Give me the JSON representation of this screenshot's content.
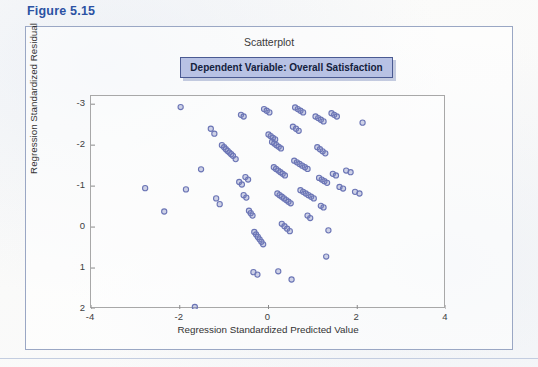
{
  "figure": {
    "caption": "Figure 5.15",
    "caption_color": "#2b52a3"
  },
  "chart_title": "Scatterplot",
  "dependent_variable_box": {
    "label": "Dependent Variable: Overall Satisfaction",
    "fill_color": "#b8c2e4",
    "border_color": "#4a5a92"
  },
  "axes": {
    "x_title": "Regression Standardized Predicted Value",
    "y_title": "Regression Standardized Residual",
    "x_ticks": [
      "-4",
      "-2",
      "0",
      "2",
      "4"
    ],
    "y_ticks": [
      "2",
      "1",
      "0",
      "-1",
      "-2",
      "-3"
    ]
  },
  "chart_data": {
    "type": "scatter",
    "title": "Scatterplot",
    "subtitle": "Dependent Variable: Overall Satisfaction",
    "xlabel": "Regression Standardized Predicted Value",
    "ylabel": "Regression Standardized Residual",
    "xlim": [
      -4,
      4
    ],
    "ylim": [
      -3,
      2.2
    ],
    "xticks": [
      -4,
      -2,
      0,
      2,
      4
    ],
    "yticks": [
      -3,
      -2,
      -1,
      0,
      1,
      2
    ],
    "grid": false,
    "legend": "none",
    "marker": {
      "shape": "open-circle",
      "color": "#6b75b5",
      "radius": 2.6,
      "fill": "rgba(120,130,190,0.35)"
    },
    "points": [
      [
        -2.78,
        -0.05
      ],
      [
        -2.35,
        -0.62
      ],
      [
        -1.98,
        1.93
      ],
      [
        -1.86,
        -0.08
      ],
      [
        -1.66,
        -2.95
      ],
      [
        -1.52,
        0.41
      ],
      [
        -1.3,
        1.4
      ],
      [
        -1.22,
        1.28
      ],
      [
        -1.18,
        -0.3
      ],
      [
        -1.1,
        -0.44
      ],
      [
        -1.05,
        1.0
      ],
      [
        -1.0,
        0.95
      ],
      [
        -0.96,
        0.9
      ],
      [
        -0.92,
        0.86
      ],
      [
        -0.88,
        0.82
      ],
      [
        -0.84,
        0.78
      ],
      [
        -0.8,
        0.74
      ],
      [
        -0.74,
        0.66
      ],
      [
        -0.62,
        1.74
      ],
      [
        -0.56,
        1.7
      ],
      [
        -0.52,
        0.22
      ],
      [
        -0.46,
        0.16
      ],
      [
        -0.44,
        -0.6
      ],
      [
        -0.4,
        -0.66
      ],
      [
        -0.36,
        -0.72
      ],
      [
        -0.56,
        -0.22
      ],
      [
        -0.5,
        -0.28
      ],
      [
        -0.66,
        0.1
      ],
      [
        -0.6,
        0.04
      ],
      [
        -0.32,
        -1.12
      ],
      [
        -0.28,
        -1.18
      ],
      [
        -0.24,
        -1.24
      ],
      [
        -0.2,
        -1.3
      ],
      [
        -0.16,
        -1.36
      ],
      [
        -0.12,
        -1.42
      ],
      [
        -0.34,
        -2.1
      ],
      [
        -0.25,
        -2.16
      ],
      [
        -0.1,
        1.88
      ],
      [
        -0.04,
        1.84
      ],
      [
        0.02,
        1.8
      ],
      [
        0.0,
        1.26
      ],
      [
        0.05,
        1.22
      ],
      [
        0.1,
        1.18
      ],
      [
        0.15,
        1.14
      ],
      [
        0.08,
        1.08
      ],
      [
        0.13,
        1.04
      ],
      [
        0.18,
        1.0
      ],
      [
        0.23,
        0.96
      ],
      [
        0.28,
        0.92
      ],
      [
        0.12,
        0.46
      ],
      [
        0.17,
        0.42
      ],
      [
        0.22,
        0.38
      ],
      [
        0.27,
        0.34
      ],
      [
        0.32,
        0.3
      ],
      [
        0.37,
        0.26
      ],
      [
        0.2,
        -0.18
      ],
      [
        0.25,
        -0.22
      ],
      [
        0.3,
        -0.26
      ],
      [
        0.35,
        -0.3
      ],
      [
        0.4,
        -0.34
      ],
      [
        0.45,
        -0.38
      ],
      [
        0.5,
        -0.42
      ],
      [
        0.3,
        -0.92
      ],
      [
        0.36,
        -0.98
      ],
      [
        0.42,
        -1.04
      ],
      [
        0.48,
        -1.1
      ],
      [
        0.22,
        -2.08
      ],
      [
        0.52,
        -2.28
      ],
      [
        0.6,
        1.92
      ],
      [
        0.66,
        1.88
      ],
      [
        0.72,
        1.84
      ],
      [
        0.78,
        1.8
      ],
      [
        0.55,
        1.45
      ],
      [
        0.62,
        1.4
      ],
      [
        0.68,
        1.35
      ],
      [
        0.58,
        0.62
      ],
      [
        0.64,
        0.58
      ],
      [
        0.7,
        0.54
      ],
      [
        0.76,
        0.5
      ],
      [
        0.82,
        0.46
      ],
      [
        0.88,
        0.42
      ],
      [
        0.72,
        -0.1
      ],
      [
        0.78,
        -0.14
      ],
      [
        0.84,
        -0.18
      ],
      [
        0.9,
        -0.22
      ],
      [
        0.96,
        -0.26
      ],
      [
        1.02,
        -0.3
      ],
      [
        0.88,
        -0.72
      ],
      [
        0.94,
        -0.78
      ],
      [
        1.06,
        1.7
      ],
      [
        1.12,
        1.66
      ],
      [
        1.18,
        1.62
      ],
      [
        1.24,
        1.58
      ],
      [
        1.1,
        0.95
      ],
      [
        1.16,
        0.9
      ],
      [
        1.22,
        0.85
      ],
      [
        1.28,
        0.8
      ],
      [
        1.14,
        0.2
      ],
      [
        1.2,
        0.16
      ],
      [
        1.26,
        0.12
      ],
      [
        1.32,
        0.08
      ],
      [
        1.18,
        -0.48
      ],
      [
        1.24,
        -0.52
      ],
      [
        1.42,
        1.78
      ],
      [
        1.48,
        1.74
      ],
      [
        1.54,
        1.7
      ],
      [
        1.45,
        0.3
      ],
      [
        1.52,
        0.26
      ],
      [
        1.6,
        -0.02
      ],
      [
        1.68,
        -0.06
      ],
      [
        1.35,
        -1.08
      ],
      [
        1.3,
        -1.72
      ],
      [
        1.75,
        0.38
      ],
      [
        1.85,
        0.34
      ],
      [
        1.95,
        -0.14
      ],
      [
        2.05,
        -0.18
      ],
      [
        2.12,
        1.55
      ]
    ]
  }
}
